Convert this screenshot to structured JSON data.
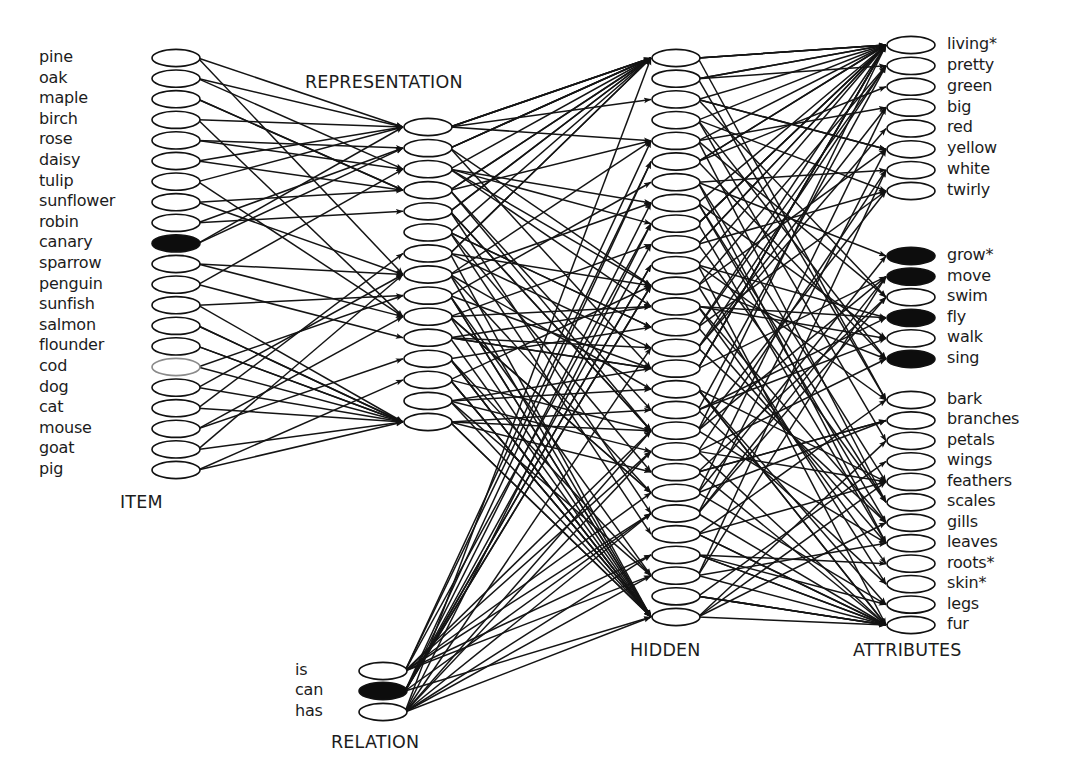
{
  "diagram": {
    "layers": {
      "item": {
        "title": "ITEM",
        "units": [
          "pine",
          "oak",
          "maple",
          "birch",
          "rose",
          "daisy",
          "tulip",
          "sunflower",
          "robin",
          "canary",
          "sparrow",
          "penguin",
          "sunfish",
          "salmon",
          "flounder",
          "cod",
          "dog",
          "cat",
          "mouse",
          "goat",
          "pig"
        ],
        "active": [
          "canary"
        ],
        "faint": [
          "cod"
        ]
      },
      "representation": {
        "title": "REPRESENTATION",
        "unit_count": 15
      },
      "hidden": {
        "title": "HIDDEN",
        "unit_count": 28
      },
      "relation": {
        "title": "RELATION",
        "units": [
          "is",
          "can",
          "has"
        ],
        "active": [
          "can"
        ]
      },
      "attributes": {
        "title": "ATTRIBUTES",
        "groups": [
          {
            "units": [
              "living*",
              "pretty",
              "green",
              "big",
              "red",
              "yellow",
              "white",
              "twirly"
            ],
            "active": []
          },
          {
            "units": [
              "grow*",
              "move",
              "swim",
              "fly",
              "walk",
              "sing"
            ],
            "active": [
              "grow*",
              "move",
              "fly",
              "sing"
            ]
          },
          {
            "units": [
              "bark",
              "branches",
              "petals",
              "wings",
              "feathers",
              "scales",
              "gills",
              "leaves",
              "roots*",
              "skin*",
              "legs",
              "fur"
            ],
            "active": []
          }
        ]
      }
    },
    "connections": [
      {
        "from": "item",
        "to": "representation",
        "note": "feed-forward weights (subset drawn)"
      },
      {
        "from": "representation",
        "to": "hidden"
      },
      {
        "from": "relation",
        "to": "hidden"
      },
      {
        "from": "hidden",
        "to": "attributes"
      }
    ],
    "colors": {
      "ink": "#111111",
      "active_fill": "#0d0d0d",
      "inactive_fill": "#ffffff",
      "faint_stroke": "#8a8a8a"
    }
  }
}
